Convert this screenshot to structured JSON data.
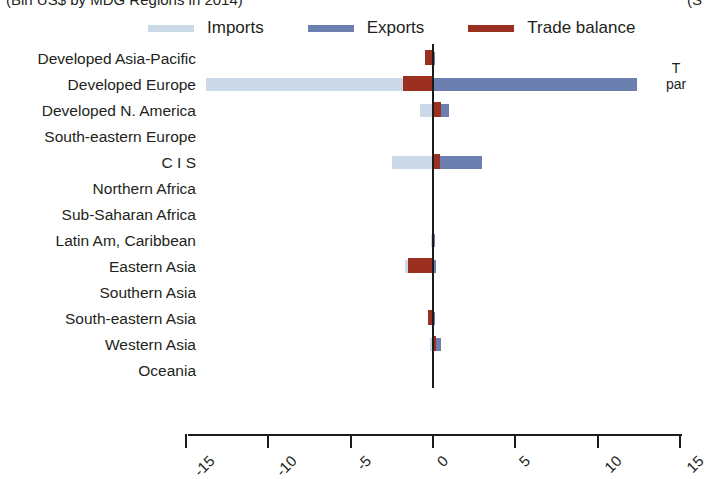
{
  "header": {
    "subtitle_left": "(Bln US$ by MDG Regions in 2014)",
    "subtitle_right": "(S",
    "side_note_line1": "T",
    "side_note_line2": "par"
  },
  "legend": {
    "items": [
      {
        "label": "Imports",
        "color": "#ccd9e8",
        "name": "imports"
      },
      {
        "label": "Exports",
        "color": "#6b7fb0",
        "name": "exports"
      },
      {
        "label": "Trade balance",
        "color": "#9c3020",
        "name": "trade-balance"
      }
    ]
  },
  "colors": {
    "imports": "#ccd9e8",
    "exports": "#6b7fb0",
    "balance": "#9c3020",
    "axis": "#1b1b1b",
    "text": "#231f20"
  },
  "chart_data": {
    "type": "bar",
    "orientation": "horizontal",
    "title": "(Bln US$ by MDG Regions in 2014)",
    "xlabel": "",
    "ylabel": "",
    "xlim": [
      -15,
      15
    ],
    "grid": false,
    "legend_position": "top",
    "xticks": [
      -15,
      -10,
      -5,
      0,
      5,
      10,
      15
    ],
    "xtick_labels": [
      "-15",
      "-10",
      "-5",
      "0",
      "5",
      "10",
      "15"
    ],
    "categories": [
      "Developed Asia-Pacific",
      "Developed Europe",
      "Developed N. America",
      "South-eastern Europe",
      "C I S",
      "Northern Africa",
      "Sub-Saharan Africa",
      "Latin Am, Caribbean",
      "Eastern Asia",
      "Southern Asia",
      "South-eastern Asia",
      "Western Asia",
      "Oceania"
    ],
    "series": [
      {
        "name": "Imports",
        "color": "#ccd9e8",
        "values": [
          -0.1,
          -13.8,
          -0.8,
          0.0,
          -2.5,
          0.0,
          0.0,
          -0.1,
          -1.7,
          0.0,
          -0.15,
          -0.2,
          0.0
        ]
      },
      {
        "name": "Exports",
        "color": "#6b7fb0",
        "values": [
          0.05,
          12.4,
          1.0,
          0.0,
          3.0,
          0.0,
          0.0,
          0.1,
          0.2,
          0.0,
          0.05,
          0.5,
          0.0
        ]
      },
      {
        "name": "Trade balance",
        "color": "#9c3020",
        "values": [
          -0.5,
          -1.8,
          0.5,
          0.0,
          0.4,
          0.0,
          0.0,
          0.0,
          -1.5,
          0.0,
          -0.3,
          0.05,
          0.0
        ]
      }
    ]
  }
}
